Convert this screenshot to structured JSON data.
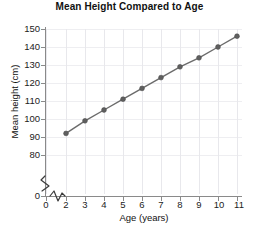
{
  "chart_data": {
    "type": "line",
    "title": "Mean Height Compared to Age",
    "xlabel": "Age (years)",
    "ylabel": "Mean height (cm)",
    "x": [
      2,
      3,
      4,
      5,
      6,
      7,
      8,
      9,
      10,
      11
    ],
    "values": [
      92,
      99,
      105,
      111,
      117,
      123,
      129,
      134,
      140,
      146
    ],
    "series": [
      {
        "name": "Mean height",
        "values": [
          92,
          99,
          105,
          111,
          117,
          123,
          129,
          134,
          140,
          146
        ]
      }
    ],
    "xlim": [
      2,
      11
    ],
    "ylim": [
      80,
      150
    ],
    "xticks": [
      "0",
      "2",
      "3",
      "4",
      "5",
      "6",
      "7",
      "8",
      "9",
      "10",
      "11"
    ],
    "yticks": [
      "0",
      "80",
      "90",
      "100",
      "110",
      "120",
      "130",
      "140",
      "150"
    ],
    "grid": true,
    "legend": "none",
    "axis_break_x": true,
    "axis_break_y": true,
    "line_color": "#6b6b6b",
    "marker_color": "#5f5f5f",
    "grid_color": "#e8e8ec",
    "axis_color": "#8a8a8a"
  },
  "axis": {
    "y_tick_labels": [
      "150",
      "140",
      "130",
      "120",
      "110",
      "100",
      "90",
      "80",
      "0"
    ],
    "x_tick_labels": [
      "0",
      "2",
      "3",
      "4",
      "5",
      "6",
      "7",
      "8",
      "9",
      "10",
      "11"
    ]
  },
  "icons": {
    "y_axis_break": "zigzag-break-icon",
    "x_axis_break": "zigzag-break-icon"
  }
}
